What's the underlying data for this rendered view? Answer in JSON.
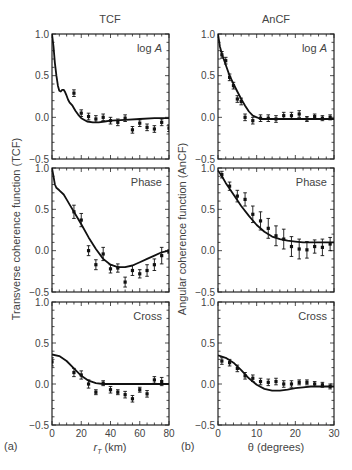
{
  "figure": {
    "left_column_title": "TCF",
    "right_column_title": "AnCF",
    "left_ylabel": "Transverse coherence function (TCF)",
    "right_ylabel": "Angular coherence function (AnCF)",
    "left_xlabel_main": "r",
    "left_xlabel_sub": "T",
    "left_xlabel_unit": " (km)",
    "right_xlabel": "θ (degrees)",
    "left_panel_tag": "(a)",
    "right_panel_tag": "(b)",
    "panel_labels": [
      "log A",
      "Phase",
      "Cross"
    ],
    "yticks": [
      "1.0",
      "0.5",
      "0.0",
      "−0.5"
    ],
    "left_xticks": [
      "0",
      "20",
      "40",
      "60",
      "80"
    ],
    "right_xticks": [
      "0",
      "10",
      "20",
      "30"
    ]
  },
  "chart_data": [
    {
      "type": "line+scatter",
      "title": "TCF",
      "panel": "log A",
      "xlabel": "r_T (km)",
      "ylabel": "Transverse coherence function (TCF)",
      "xlim": [
        0,
        80
      ],
      "ylim": [
        -0.5,
        1.0
      ],
      "model_curve": {
        "x": [
          0,
          1,
          2,
          3,
          4,
          5,
          6,
          7,
          8,
          9,
          10,
          11,
          12,
          14,
          16,
          18,
          20,
          24,
          28,
          32,
          36,
          40,
          50,
          60,
          70,
          80
        ],
        "y": [
          1.0,
          0.85,
          0.65,
          0.5,
          0.38,
          0.32,
          0.31,
          0.33,
          0.33,
          0.3,
          0.26,
          0.21,
          0.18,
          0.14,
          0.08,
          0.03,
          -0.01,
          -0.05,
          -0.06,
          -0.06,
          -0.05,
          -0.04,
          -0.03,
          -0.02,
          -0.01,
          -0.01
        ]
      },
      "points": {
        "x": [
          15,
          20,
          25,
          30,
          35,
          40,
          45,
          50,
          55,
          60,
          65,
          70,
          75,
          80
        ],
        "y": [
          0.29,
          0.05,
          0.01,
          -0.02,
          0.0,
          -0.04,
          -0.06,
          -0.01,
          -0.15,
          -0.07,
          -0.12,
          -0.14,
          -0.06,
          -0.13
        ],
        "err": [
          0.04,
          0.04,
          0.04,
          0.04,
          0.04,
          0.04,
          0.04,
          0.04,
          0.04,
          0.04,
          0.04,
          0.04,
          0.04,
          0.04
        ]
      }
    },
    {
      "type": "line+scatter",
      "title": "TCF",
      "panel": "Phase",
      "xlabel": "r_T (km)",
      "xlim": [
        0,
        80
      ],
      "ylim": [
        -0.5,
        1.0
      ],
      "model_curve": {
        "x": [
          0,
          1,
          2,
          3,
          5,
          8,
          10,
          12,
          15,
          20,
          25,
          30,
          35,
          40,
          45,
          50,
          55,
          60,
          65,
          70,
          75,
          80
        ],
        "y": [
          1.0,
          0.9,
          0.8,
          0.76,
          0.73,
          0.68,
          0.62,
          0.56,
          0.47,
          0.32,
          0.16,
          0.02,
          -0.1,
          -0.17,
          -0.2,
          -0.2,
          -0.18,
          -0.14,
          -0.1,
          -0.06,
          -0.02,
          0.0
        ]
      },
      "points": {
        "x": [
          15,
          20,
          25,
          30,
          35,
          40,
          45,
          50,
          55,
          60,
          65,
          70,
          75,
          80
        ],
        "y": [
          0.47,
          0.37,
          0.0,
          -0.17,
          -0.04,
          -0.22,
          -0.21,
          -0.38,
          -0.24,
          -0.28,
          -0.24,
          -0.17,
          -0.06,
          -0.01
        ],
        "err": [
          0.08,
          0.08,
          0.06,
          0.06,
          0.08,
          0.05,
          0.05,
          0.06,
          0.06,
          0.05,
          0.07,
          0.07,
          0.1,
          0.02
        ]
      }
    },
    {
      "type": "line+scatter",
      "title": "TCF",
      "panel": "Cross",
      "xlabel": "r_T (km)",
      "xlim": [
        0,
        80
      ],
      "ylim": [
        -0.5,
        1.0
      ],
      "model_curve": {
        "x": [
          0,
          5,
          10,
          15,
          20,
          25,
          30,
          35,
          40,
          50,
          60,
          70,
          80
        ],
        "y": [
          0.36,
          0.34,
          0.28,
          0.19,
          0.1,
          0.04,
          0.01,
          0.0,
          0.0,
          0.0,
          0.0,
          0.0,
          0.0
        ]
      },
      "points": {
        "x": [
          0,
          15,
          20,
          25,
          30,
          35,
          40,
          45,
          50,
          55,
          60,
          65,
          70,
          75
        ],
        "y": [
          0.27,
          0.14,
          0.11,
          0.0,
          -0.1,
          0.01,
          -0.07,
          -0.1,
          -0.13,
          -0.18,
          -0.07,
          -0.12,
          0.05,
          0.03
        ],
        "err": [
          0.05,
          0.05,
          0.05,
          0.05,
          0.03,
          0.03,
          0.04,
          0.03,
          0.04,
          0.04,
          0.03,
          0.04,
          0.04,
          0.05
        ]
      }
    },
    {
      "type": "line+scatter",
      "title": "AnCF",
      "panel": "log A",
      "xlabel": "θ (degrees)",
      "ylabel": "Angular coherence function (AnCF)",
      "xlim": [
        0,
        30
      ],
      "ylim": [
        -0.5,
        1.0
      ],
      "model_curve": {
        "x": [
          0,
          0.5,
          1,
          2,
          3,
          4,
          5,
          6,
          7,
          8,
          9,
          10,
          11,
          12,
          14,
          16,
          20,
          25,
          30
        ],
        "y": [
          1.0,
          0.85,
          0.76,
          0.63,
          0.5,
          0.4,
          0.31,
          0.22,
          0.14,
          0.07,
          0.02,
          0.0,
          -0.02,
          -0.02,
          -0.02,
          -0.02,
          -0.02,
          -0.02,
          -0.02
        ]
      },
      "points": {
        "x": [
          1,
          2,
          3,
          4,
          5,
          6,
          7,
          9,
          11,
          13,
          15,
          17,
          19,
          21,
          23,
          25,
          27,
          29
        ],
        "y": [
          0.75,
          0.68,
          0.48,
          0.38,
          0.22,
          0.19,
          0.0,
          -0.04,
          -0.01,
          -0.01,
          -0.02,
          0.02,
          0.02,
          0.04,
          -0.02,
          0.01,
          -0.01,
          0.0
        ],
        "err": [
          0.04,
          0.04,
          0.04,
          0.04,
          0.04,
          0.04,
          0.04,
          0.04,
          0.04,
          0.04,
          0.04,
          0.04,
          0.04,
          0.04,
          0.03,
          0.03,
          0.03,
          0.03
        ]
      }
    },
    {
      "type": "line+scatter",
      "title": "AnCF",
      "panel": "Phase",
      "xlabel": "θ (degrees)",
      "xlim": [
        0,
        30
      ],
      "ylim": [
        -0.5,
        1.0
      ],
      "model_curve": {
        "x": [
          0,
          1,
          2,
          4,
          6,
          8,
          10,
          12,
          14,
          16,
          18,
          20,
          22,
          24,
          26,
          28,
          30
        ],
        "y": [
          0.97,
          0.9,
          0.82,
          0.68,
          0.54,
          0.42,
          0.31,
          0.23,
          0.17,
          0.14,
          0.12,
          0.11,
          0.1,
          0.1,
          0.1,
          0.1,
          0.1
        ]
      },
      "points": {
        "x": [
          1,
          3,
          5,
          7,
          9,
          11,
          13,
          15,
          17,
          19,
          21,
          23,
          25,
          27,
          29
        ],
        "y": [
          0.92,
          0.78,
          0.66,
          0.62,
          0.44,
          0.36,
          0.27,
          0.18,
          0.14,
          0.05,
          0.02,
          0.01,
          0.05,
          0.04,
          0.08
        ],
        "err": [
          0.04,
          0.05,
          0.07,
          0.08,
          0.1,
          0.11,
          0.12,
          0.12,
          0.12,
          0.12,
          0.12,
          0.1,
          0.08,
          0.1,
          0.08
        ]
      }
    },
    {
      "type": "line+scatter",
      "title": "AnCF",
      "panel": "Cross",
      "xlabel": "θ (degrees)",
      "xlim": [
        0,
        30
      ],
      "ylim": [
        -0.5,
        1.0
      ],
      "model_curve": {
        "x": [
          0,
          2,
          4,
          6,
          8,
          10,
          12,
          14,
          16,
          18,
          20,
          22,
          24,
          26,
          28,
          30
        ],
        "y": [
          0.35,
          0.32,
          0.26,
          0.17,
          0.07,
          -0.01,
          -0.06,
          -0.08,
          -0.08,
          -0.07,
          -0.05,
          -0.04,
          -0.03,
          -0.03,
          -0.03,
          -0.03
        ]
      },
      "points": {
        "x": [
          1,
          3,
          5,
          7,
          9,
          11,
          13,
          15,
          17,
          19,
          21,
          23,
          25,
          27,
          29
        ],
        "y": [
          0.28,
          0.26,
          0.19,
          0.1,
          0.07,
          0.03,
          0.02,
          0.03,
          0.0,
          0.0,
          0.02,
          0.02,
          0.0,
          -0.01,
          -0.03
        ],
        "err": [
          0.04,
          0.04,
          0.04,
          0.04,
          0.04,
          0.04,
          0.04,
          0.04,
          0.04,
          0.04,
          0.03,
          0.03,
          0.03,
          0.03,
          0.03
        ]
      }
    }
  ]
}
